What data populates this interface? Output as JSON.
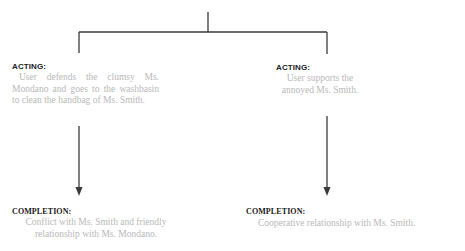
{
  "diagram": {
    "branches": [
      {
        "id": "left",
        "acting": {
          "heading": "ACTING:",
          "text": "User defends the clumsy Ms. Mondano and goes to the washbasin to clean the handbag of Ms. Smith."
        },
        "completion": {
          "heading": "COMPLETION:",
          "text_line1": "Conflict with Ms. Smith and friendly",
          "text_line2": "relationship with Ms. Mondano."
        }
      },
      {
        "id": "right",
        "acting": {
          "heading": "ACTING:",
          "text_line1": "User supports the",
          "text_line2": "annoyed Ms. Smith."
        },
        "completion": {
          "heading": "COMPLETION:",
          "text": "Cooperative relationship with Ms. Smith."
        }
      }
    ],
    "colors": {
      "line": "#3a3a3a",
      "heading": "#222222",
      "body": "#b8b8b8"
    }
  }
}
